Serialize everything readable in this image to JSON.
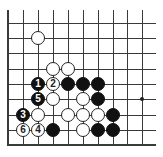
{
  "diagram": {
    "type": "go-board-fragment",
    "columns": 10,
    "rows": 9,
    "col_x": [
      8,
      23,
      38,
      53,
      68,
      83,
      98,
      113,
      127,
      142
    ],
    "row_y": [
      23,
      38,
      53,
      69,
      84,
      99,
      115,
      130,
      145
    ],
    "edges": {
      "left": true,
      "bottom": true,
      "top": false,
      "right": false
    },
    "colors": {
      "line": "#3a3a3a",
      "black_stone": "#111111",
      "white_stone": "#ffffff"
    },
    "star_points": [
      {
        "col": 9,
        "row": 5
      }
    ],
    "stones": [
      {
        "color": "white",
        "col": 2,
        "row": 1,
        "label": ""
      },
      {
        "color": "white",
        "col": 3,
        "row": 3,
        "label": ""
      },
      {
        "color": "white",
        "col": 4,
        "row": 3,
        "label": ""
      },
      {
        "color": "black",
        "col": 2,
        "row": 4,
        "label": "1"
      },
      {
        "color": "white",
        "col": 3,
        "row": 4,
        "label": "2"
      },
      {
        "color": "black",
        "col": 4,
        "row": 4,
        "label": ""
      },
      {
        "color": "black",
        "col": 5,
        "row": 4,
        "label": ""
      },
      {
        "color": "black",
        "col": 6,
        "row": 4,
        "label": ""
      },
      {
        "color": "black",
        "col": 2,
        "row": 5,
        "label": "5"
      },
      {
        "color": "white",
        "col": 3,
        "row": 5,
        "label": ""
      },
      {
        "color": "white",
        "col": 5,
        "row": 5,
        "label": ""
      },
      {
        "color": "black",
        "col": 6,
        "row": 5,
        "label": ""
      },
      {
        "color": "black",
        "col": 1,
        "row": 6,
        "label": "3"
      },
      {
        "color": "white",
        "col": 2,
        "row": 6,
        "label": ""
      },
      {
        "color": "white",
        "col": 4,
        "row": 6,
        "label": ""
      },
      {
        "color": "white",
        "col": 5,
        "row": 6,
        "label": ""
      },
      {
        "color": "white",
        "col": 6,
        "row": 6,
        "label": ""
      },
      {
        "color": "black",
        "col": 7,
        "row": 6,
        "label": ""
      },
      {
        "color": "white",
        "col": 1,
        "row": 7,
        "label": "6"
      },
      {
        "color": "white",
        "col": 2,
        "row": 7,
        "label": "4"
      },
      {
        "color": "black",
        "col": 3,
        "row": 7,
        "label": ""
      },
      {
        "color": "white",
        "col": 5,
        "row": 7,
        "label": ""
      },
      {
        "color": "black",
        "col": 6,
        "row": 7,
        "label": ""
      },
      {
        "color": "black",
        "col": 7,
        "row": 7,
        "label": ""
      }
    ]
  }
}
